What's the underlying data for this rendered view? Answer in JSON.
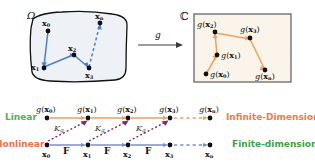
{
  "figure": {
    "top_panel": {
      "domain_symbol": "Ω",
      "codomain_symbol": "ℂ",
      "map_label": "g",
      "domain_points": [
        {
          "name": "x0",
          "base": "x",
          "sub": "0",
          "x": 48,
          "y": 28
        },
        {
          "name": "x1",
          "base": "x",
          "sub": "1",
          "x": 42,
          "y": 65
        },
        {
          "name": "x2",
          "base": "x",
          "sub": "2",
          "x": 74,
          "y": 52
        },
        {
          "name": "x3",
          "base": "x",
          "sub": "3",
          "x": 92,
          "y": 66
        },
        {
          "name": "xn",
          "base": "x",
          "sub": "n",
          "x": 100,
          "y": 21
        }
      ],
      "codomain_points": [
        {
          "name": "g(x0)",
          "base": "x",
          "sub": "0",
          "x": 207,
          "y": 73
        },
        {
          "name": "g(x1)",
          "base": "x",
          "sub": "1",
          "x": 218,
          "y": 54
        },
        {
          "name": "g(x2)",
          "base": "x",
          "sub": "2",
          "x": 217,
          "y": 31
        },
        {
          "name": "g(x3)",
          "base": "x",
          "sub": "3",
          "x": 250,
          "y": 35
        },
        {
          "name": "g(xn)",
          "base": "x",
          "sub": "n",
          "x": 266,
          "y": 67
        }
      ]
    },
    "ladder": {
      "row_linear_label": "Linear",
      "row_nonlinear_label": "Nonlinear",
      "right_label_top": "Infinite-Dimensional",
      "right_label_bottom": "Finite-dimensional",
      "operator_label_base": "K",
      "operator_label_sub": "g",
      "flow_map_label": "F",
      "top_nodes": [
        {
          "label_base": "x",
          "label_sub": "0",
          "x": 47
        },
        {
          "label_base": "x",
          "label_sub": "1",
          "x": 88
        },
        {
          "label_base": "x",
          "label_sub": "2",
          "x": 128
        },
        {
          "label_base": "x",
          "label_sub": "3",
          "x": 170
        },
        {
          "label_base": "x",
          "label_sub": "n",
          "x": 210
        }
      ],
      "bottom_nodes": [
        {
          "label_base": "x",
          "label_sub": "0",
          "x": 47
        },
        {
          "label_base": "x",
          "label_sub": "1",
          "x": 88
        },
        {
          "label_base": "x",
          "label_sub": "2",
          "x": 128
        },
        {
          "label_base": "x",
          "label_sub": "3",
          "x": 170
        },
        {
          "label_base": "x",
          "label_sub": "n",
          "x": 210
        }
      ]
    },
    "colors": {
      "linear_text": "#53b14f",
      "nonlinear_text": "#f4704a",
      "infinite_text": "#ef7d42",
      "finite_text": "#3fa24a",
      "top_arrow": "#eba055",
      "bottom_arrow": "#7b8ec8",
      "koopman_arrow": "#7b2d6b",
      "node_dot": "#111111",
      "omega_fill": "#eef2f7",
      "omega_stroke": "#111111",
      "c_fill": "#fbf4ea",
      "c_stroke": "#5a5a5a",
      "domain_edge": "#4e7fc1",
      "codomain_edge": "#eda357"
    }
  }
}
